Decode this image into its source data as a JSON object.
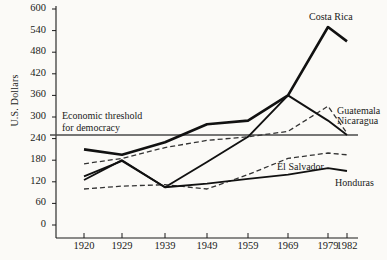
{
  "figure": {
    "ylabel": "U.S. Dollars",
    "threshold_note_line1": "Economic threshold",
    "threshold_note_line2": "for democracy",
    "caption": ""
  },
  "chart_data": {
    "type": "line",
    "title": "",
    "xlabel": "",
    "ylabel": "U.S. Dollars",
    "x": [
      1920,
      1929,
      1939,
      1949,
      1959,
      1969,
      1979,
      1982
    ],
    "xtick_labels": [
      "1920",
      "1929",
      "1939",
      "1949",
      "1959",
      "1969",
      "1979",
      "1982"
    ],
    "ytick_labels": [
      "0",
      "60",
      "120",
      "180",
      "240",
      "300",
      "360",
      "420",
      "480",
      "540",
      "600"
    ],
    "yticks": [
      0,
      60,
      120,
      180,
      240,
      300,
      360,
      420,
      480,
      540,
      600
    ],
    "ylim": [
      0,
      600
    ],
    "grid": false,
    "legend": "inline-right-labels",
    "annotations": [
      {
        "text": "Economic threshold for democracy",
        "value": 250,
        "style": "horizontal-rule"
      }
    ],
    "series": [
      {
        "name": "Costa Rica",
        "style": "solid-thick",
        "values": [
          210,
          195,
          230,
          280,
          290,
          360,
          550,
          510
        ]
      },
      {
        "name": "Guatemala",
        "style": "dashed",
        "values": [
          170,
          185,
          215,
          235,
          245,
          260,
          330,
          255
        ]
      },
      {
        "name": "Nicaragua",
        "style": "solid",
        "values": [
          125,
          180,
          105,
          175,
          245,
          360,
          290,
          250
        ]
      },
      {
        "name": "El Salvador",
        "style": "dashed",
        "values": [
          100,
          108,
          112,
          100,
          140,
          185,
          200,
          195
        ]
      },
      {
        "name": "Honduras",
        "style": "solid",
        "values": [
          135,
          178,
          105,
          115,
          128,
          140,
          158,
          150
        ]
      }
    ]
  }
}
